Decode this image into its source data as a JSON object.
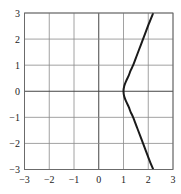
{
  "chart_data": {
    "type": "line",
    "title": "",
    "xlabel": "",
    "ylabel": "",
    "xlim": [
      -3,
      3
    ],
    "ylim": [
      -3,
      3
    ],
    "grid": true,
    "x_ticks": [
      -3,
      -2,
      -1,
      0,
      1,
      2,
      3
    ],
    "y_ticks": [
      -3,
      -2,
      -1,
      0,
      1,
      2,
      3
    ],
    "x_tick_labels": [
      "−3",
      "−2",
      "−1",
      "0",
      "1",
      "2",
      "3"
    ],
    "y_tick_labels": [
      "−3",
      "−2",
      "−1",
      "0",
      "1",
      "2",
      "3"
    ],
    "series": [
      {
        "name": "curve",
        "color": "#1a1a1a",
        "points": [
          {
            "x": 2.2,
            "y": -3.0
          },
          {
            "x": 2.03,
            "y": -2.6
          },
          {
            "x": 1.87,
            "y": -2.2
          },
          {
            "x": 1.71,
            "y": -1.8
          },
          {
            "x": 1.55,
            "y": -1.4
          },
          {
            "x": 1.39,
            "y": -1.0
          },
          {
            "x": 1.29,
            "y": -0.8
          },
          {
            "x": 1.21,
            "y": -0.6
          },
          {
            "x": 1.11,
            "y": -0.4
          },
          {
            "x": 1.03,
            "y": -0.2
          },
          {
            "x": 1.0,
            "y": 0.0
          },
          {
            "x": 1.03,
            "y": 0.2
          },
          {
            "x": 1.11,
            "y": 0.4
          },
          {
            "x": 1.21,
            "y": 0.6
          },
          {
            "x": 1.29,
            "y": 0.8
          },
          {
            "x": 1.39,
            "y": 1.0
          },
          {
            "x": 1.55,
            "y": 1.4
          },
          {
            "x": 1.71,
            "y": 1.8
          },
          {
            "x": 1.87,
            "y": 2.2
          },
          {
            "x": 2.03,
            "y": 2.6
          },
          {
            "x": 2.2,
            "y": 3.0
          }
        ]
      }
    ]
  }
}
